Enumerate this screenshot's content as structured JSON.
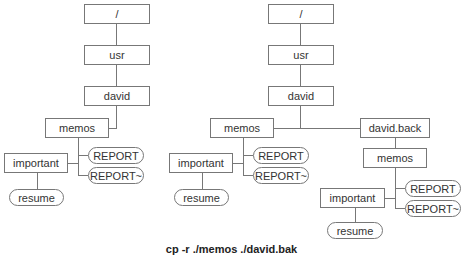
{
  "left_tree": {
    "root": "/",
    "usr": "usr",
    "david": "david",
    "memos": "memos",
    "important": "important",
    "report": "REPORT",
    "report_bak": "REPORT~",
    "resume": "resume"
  },
  "right_tree": {
    "root": "/",
    "usr": "usr",
    "david": "david",
    "memos": "memos",
    "important": "important",
    "report": "REPORT",
    "report_bak": "REPORT~",
    "resume": "resume",
    "david_back": "david.back",
    "back_memos": "memos",
    "back_important": "important",
    "back_report": "REPORT",
    "back_report_bak": "REPORT~",
    "back_resume": "resume"
  },
  "caption": "cp -r ./memos ./david.bak"
}
